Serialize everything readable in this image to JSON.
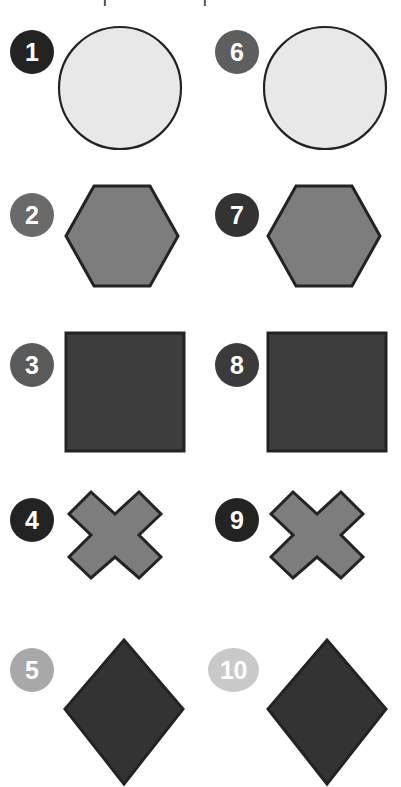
{
  "page": {
    "background": "#ffffff",
    "width": 401,
    "height": 787,
    "columns": 2,
    "rows": 5
  },
  "cropped_header": {
    "left_fragment": "|",
    "right_fragment": "|"
  },
  "palette": {
    "outline": "#232323",
    "badge_text": "#ffffff",
    "circle_fill": "#e8e8e8",
    "hexagon_fill": "#7d7d7d",
    "square_fill": "#3d3d3d",
    "cross_fill": "#7d7d7d",
    "diamond_fill": "#333333",
    "badge_very_dark": "#232323",
    "badge_dark": "#3b3b3b",
    "badge_mid_dark": "#4d4d4d",
    "badge_mid": "#5e5e5e",
    "badge_light": "#a8a8a8",
    "badge_lighter": "#c9c9c9"
  },
  "items": [
    {
      "number": "1",
      "shape": "circle",
      "shape_name": "circle-shape",
      "badge_color": "#232323",
      "fill": "#e8e8e8",
      "column": "left",
      "row": 1
    },
    {
      "number": "2",
      "shape": "hexagon",
      "shape_name": "hexagon-shape",
      "badge_color": "#6a6a6a",
      "fill": "#7d7d7d",
      "column": "left",
      "row": 2
    },
    {
      "number": "3",
      "shape": "square",
      "shape_name": "square-shape",
      "badge_color": "#5a5a5a",
      "fill": "#3d3d3d",
      "column": "left",
      "row": 3
    },
    {
      "number": "4",
      "shape": "cross",
      "shape_name": "cross-shape",
      "badge_color": "#232323",
      "fill": "#7d7d7d",
      "column": "left",
      "row": 4
    },
    {
      "number": "5",
      "shape": "diamond",
      "shape_name": "diamond-shape",
      "badge_color": "#a8a8a8",
      "fill": "#333333",
      "column": "left",
      "row": 5
    },
    {
      "number": "6",
      "shape": "circle",
      "shape_name": "circle-shape",
      "badge_color": "#5e5e5e",
      "fill": "#e8e8e8",
      "column": "right",
      "row": 1
    },
    {
      "number": "7",
      "shape": "hexagon",
      "shape_name": "hexagon-shape",
      "badge_color": "#333333",
      "fill": "#7d7d7d",
      "column": "right",
      "row": 2
    },
    {
      "number": "8",
      "shape": "square",
      "shape_name": "square-shape",
      "badge_color": "#3b3b3b",
      "fill": "#3d3d3d",
      "column": "right",
      "row": 3
    },
    {
      "number": "9",
      "shape": "cross",
      "shape_name": "cross-shape",
      "badge_color": "#232323",
      "fill": "#7d7d7d",
      "column": "right",
      "row": 4
    },
    {
      "number": "10",
      "shape": "diamond",
      "shape_name": "diamond-shape",
      "badge_color": "#c9c9c9",
      "fill": "#333333",
      "column": "right",
      "row": 5
    }
  ]
}
